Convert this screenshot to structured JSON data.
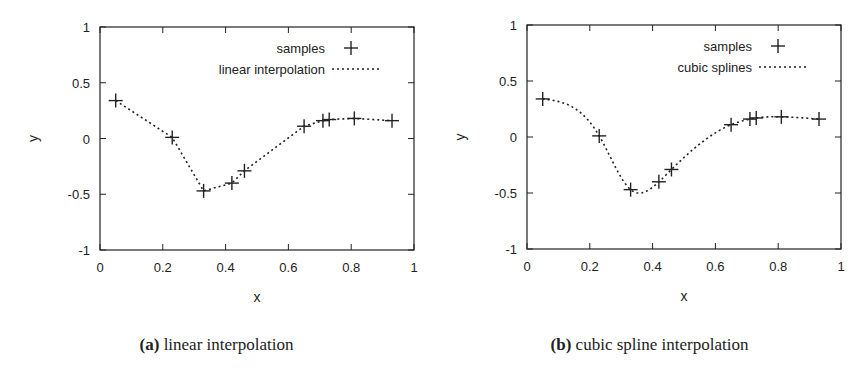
{
  "chart_data": [
    {
      "type": "line",
      "panel_label": "(a)",
      "caption": "linear interpolation",
      "title": "",
      "xlabel": "x",
      "ylabel": "y",
      "xlim": [
        0,
        1
      ],
      "ylim": [
        -1,
        1
      ],
      "xticks": [
        "0",
        "0.2",
        "0.4",
        "0.6",
        "0.8",
        "1"
      ],
      "yticks": [
        "1",
        "0.5",
        "0",
        "-0.5",
        "-1"
      ],
      "grid": false,
      "legend_position": "top-right",
      "series": [
        {
          "name": "samples",
          "style": "markers-plus",
          "x": [
            0.05,
            0.23,
            0.33,
            0.42,
            0.46,
            0.65,
            0.71,
            0.73,
            0.81,
            0.93
          ],
          "y": [
            0.34,
            0.01,
            -0.47,
            -0.4,
            -0.29,
            0.11,
            0.16,
            0.17,
            0.18,
            0.16
          ]
        },
        {
          "name": "linear interpolation",
          "style": "dotted-line",
          "interp": "linear",
          "x": [
            0.05,
            0.23,
            0.33,
            0.42,
            0.46,
            0.65,
            0.71,
            0.73,
            0.81,
            0.93
          ],
          "y": [
            0.34,
            0.01,
            -0.47,
            -0.4,
            -0.29,
            0.11,
            0.16,
            0.17,
            0.18,
            0.16
          ]
        }
      ]
    },
    {
      "type": "line",
      "panel_label": "(b)",
      "caption": "cubic spline interpolation",
      "title": "",
      "xlabel": "x",
      "ylabel": "y",
      "xlim": [
        0,
        1
      ],
      "ylim": [
        -1,
        1
      ],
      "xticks": [
        "0",
        "0.2",
        "0.4",
        "0.6",
        "0.8",
        "1"
      ],
      "yticks": [
        "1",
        "0.5",
        "0",
        "-0.5",
        "-1"
      ],
      "grid": false,
      "legend_position": "top-right",
      "series": [
        {
          "name": "samples",
          "style": "markers-plus",
          "x": [
            0.05,
            0.23,
            0.33,
            0.42,
            0.46,
            0.65,
            0.71,
            0.73,
            0.81,
            0.93
          ],
          "y": [
            0.34,
            0.01,
            -0.47,
            -0.4,
            -0.29,
            0.11,
            0.16,
            0.17,
            0.18,
            0.16
          ]
        },
        {
          "name": "cubic splines",
          "style": "dotted-line",
          "interp": "cubic-spline",
          "x": [
            0.05,
            0.23,
            0.33,
            0.42,
            0.46,
            0.65,
            0.71,
            0.73,
            0.81,
            0.93
          ],
          "y": [
            0.34,
            0.01,
            -0.47,
            -0.4,
            -0.29,
            0.11,
            0.16,
            0.17,
            0.18,
            0.16
          ]
        }
      ]
    }
  ],
  "colors": {
    "ink": "#222222",
    "frame": "#333333",
    "background": "#ffffff"
  }
}
